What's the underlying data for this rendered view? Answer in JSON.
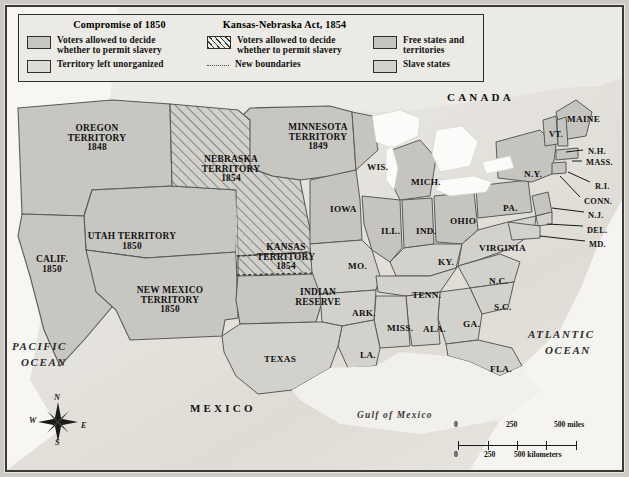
{
  "legend": {
    "title_left": "Compromise of 1850",
    "title_right": "Kansas-Nebraska Act, 1854",
    "items": [
      {
        "key": "popsov_1850",
        "swatch": "plain",
        "line1": "Voters allowed to decide",
        "line2": "whether to permit slavery"
      },
      {
        "key": "unorganized",
        "swatch": "unorg",
        "line1": "Territory left unorganized",
        "line2": ""
      },
      {
        "key": "popsov_1854",
        "swatch": "hatch",
        "line1": "Voters allowed to decide",
        "line2": "whether to permit slavery"
      },
      {
        "key": "new_boundaries",
        "swatch": "dash",
        "line1": "New boundaries",
        "line2": ""
      },
      {
        "key": "free_states",
        "swatch": "free",
        "line1": "Free states and territories",
        "line2": ""
      },
      {
        "key": "slave_states",
        "swatch": "slave",
        "line1": "Slave states",
        "line2": ""
      }
    ]
  },
  "map": {
    "countries": [
      {
        "name": "CANADA",
        "x": 447,
        "y": 92
      },
      {
        "name": "MEXICO",
        "x": 190,
        "y": 403
      }
    ],
    "oceans": [
      {
        "name": "PACIFIC",
        "x": 12,
        "y": 341
      },
      {
        "name": "OCEAN",
        "x": 21,
        "y": 357
      },
      {
        "name": "ATLANTIC",
        "x": 528,
        "y": 329
      },
      {
        "name": "OCEAN",
        "x": 545,
        "y": 345
      }
    ],
    "gulf": {
      "name": "Gulf of Mexico",
      "x": 357,
      "y": 411
    },
    "territories": [
      {
        "name": "OREGON\nTERRITORY\n1848",
        "x": 52,
        "y": 124,
        "w": 90
      },
      {
        "name": "NEBRASKA\nTERRITORY\n1854",
        "x": 185,
        "y": 155,
        "w": 92
      },
      {
        "name": "MINNESOTA\nTERRITORY\n1849",
        "x": 272,
        "y": 123,
        "w": 92
      },
      {
        "name": "UTAH TERRITORY\n1850",
        "x": 70,
        "y": 232,
        "w": 124
      },
      {
        "name": "NEW MEXICO\nTERRITORY\n1850",
        "x": 118,
        "y": 286,
        "w": 104
      },
      {
        "name": "KANSAS\nTERRITORY\n1854",
        "x": 248,
        "y": 243,
        "w": 76
      },
      {
        "name": "INDIAN\nRESERVE",
        "x": 285,
        "y": 288,
        "w": 66
      },
      {
        "name": "CALIF.\n1850",
        "x": 28,
        "y": 255,
        "w": 48
      }
    ],
    "states": [
      {
        "name": "WIS.",
        "x": 367,
        "y": 163,
        "size": "st"
      },
      {
        "name": "MICH.",
        "x": 411,
        "y": 178,
        "size": "st"
      },
      {
        "name": "IOWA",
        "x": 330,
        "y": 205,
        "size": "st"
      },
      {
        "name": "ILL.",
        "x": 381,
        "y": 227,
        "size": "st"
      },
      {
        "name": "IND.",
        "x": 416,
        "y": 227,
        "size": "st"
      },
      {
        "name": "OHIO",
        "x": 450,
        "y": 217,
        "size": "st"
      },
      {
        "name": "PA.",
        "x": 503,
        "y": 204,
        "size": "st"
      },
      {
        "name": "N.Y.",
        "x": 524,
        "y": 170,
        "size": "st"
      },
      {
        "name": "VT.",
        "x": 549,
        "y": 131,
        "size": "stsm"
      },
      {
        "name": "MAINE",
        "x": 567,
        "y": 115,
        "size": "st"
      },
      {
        "name": "N.H.",
        "x": 588,
        "y": 148,
        "size": "stsm"
      },
      {
        "name": "MASS.",
        "x": 586,
        "y": 159,
        "size": "stsm"
      },
      {
        "name": "R.I.",
        "x": 595,
        "y": 183,
        "size": "stsm"
      },
      {
        "name": "CONN.",
        "x": 584,
        "y": 198,
        "size": "stsm"
      },
      {
        "name": "N.J.",
        "x": 588,
        "y": 212,
        "size": "stsm"
      },
      {
        "name": "DEL.",
        "x": 587,
        "y": 227,
        "size": "stsm"
      },
      {
        "name": "MD.",
        "x": 589,
        "y": 241,
        "size": "stsm"
      },
      {
        "name": "VIRGINIA",
        "x": 479,
        "y": 244,
        "size": "st"
      },
      {
        "name": "N.C.",
        "x": 489,
        "y": 277,
        "size": "st"
      },
      {
        "name": "S.C.",
        "x": 494,
        "y": 303,
        "size": "st"
      },
      {
        "name": "GA.",
        "x": 463,
        "y": 320,
        "size": "st"
      },
      {
        "name": "FLA.",
        "x": 490,
        "y": 365,
        "size": "st"
      },
      {
        "name": "ALA.",
        "x": 423,
        "y": 325,
        "size": "st"
      },
      {
        "name": "MISS.",
        "x": 387,
        "y": 324,
        "size": "st"
      },
      {
        "name": "TENN.",
        "x": 412,
        "y": 291,
        "size": "st"
      },
      {
        "name": "KY.",
        "x": 438,
        "y": 258,
        "size": "st"
      },
      {
        "name": "MO.",
        "x": 348,
        "y": 262,
        "size": "st"
      },
      {
        "name": "ARK.",
        "x": 352,
        "y": 309,
        "size": "st"
      },
      {
        "name": "LA.",
        "x": 360,
        "y": 351,
        "size": "st"
      },
      {
        "name": "TEXAS",
        "x": 264,
        "y": 355,
        "size": "st"
      }
    ]
  },
  "scale": {
    "miles": {
      "zero": "0",
      "mid": "250",
      "end": "500 miles"
    },
    "km": {
      "zero": "0",
      "mid": "250",
      "end": "500 kilometers"
    }
  },
  "compass": {
    "n": "N",
    "s": "S",
    "e": "E",
    "w": "W"
  },
  "colors": {
    "land_free": "#c6c4be",
    "land_slave": "#d3d1cb",
    "territory": "#c8c6c0",
    "unorganized": "#dedcd6",
    "water": "#f4f3ef",
    "border": "#5a5a56",
    "frame": "#2e2e2c"
  }
}
